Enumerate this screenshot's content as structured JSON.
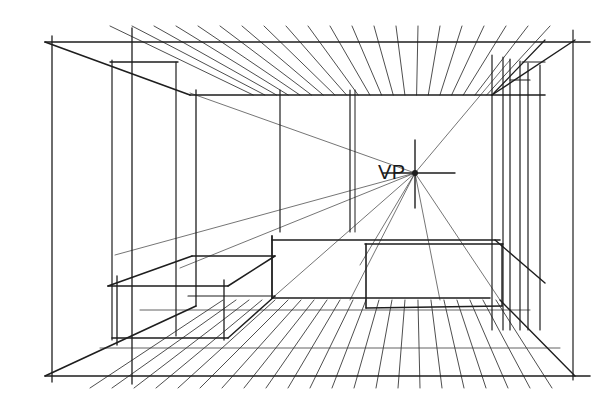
{
  "annotations": {
    "vanishing_point_label": "VP"
  },
  "style": {
    "ink_color": "#1e1e1e",
    "light_ink_color": "#3a3a3a",
    "background": "#ffffff"
  },
  "scene": {
    "type": "one-point perspective interior",
    "elements": [
      "ceiling",
      "floor",
      "back-wall",
      "left-wall",
      "right-wall",
      "left-box",
      "center-box",
      "right-wall-openings",
      "vanishing-point-crosshair",
      "convergence-lines"
    ]
  }
}
